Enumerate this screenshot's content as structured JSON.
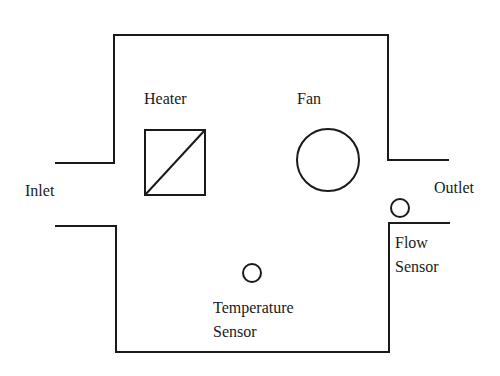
{
  "diagram": {
    "type": "schematic",
    "title": "",
    "labels": {
      "heater": "Heater",
      "fan": "Fan",
      "inlet": "Inlet",
      "outlet": "Outlet",
      "flow_sensor_line1": "Flow",
      "flow_sensor_line2": "Sensor",
      "temp_sensor_line1": "Temperature",
      "temp_sensor_line2": "Sensor"
    },
    "components": [
      {
        "id": "heater",
        "shape": "square-with-diagonal"
      },
      {
        "id": "fan",
        "shape": "circle"
      },
      {
        "id": "flow-sensor",
        "shape": "small-circle"
      },
      {
        "id": "temperature-sensor",
        "shape": "small-circle"
      }
    ],
    "colors": {
      "stroke": "#1a1a1a",
      "background": "#ffffff"
    }
  }
}
